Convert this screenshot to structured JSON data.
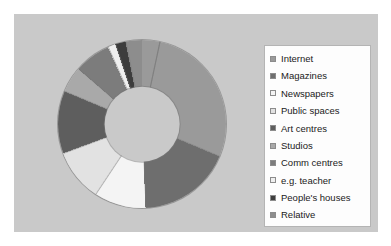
{
  "figure": {
    "background_color": "#c9c9c9",
    "page_color": "#ffffff",
    "legend_background": "#fdfdfd",
    "legend_border_color": "#b4b4b4"
  },
  "legend": {
    "position": "right",
    "items": [
      {
        "label": "Internet",
        "color": "#9a9a9a"
      },
      {
        "label": "Magazines",
        "color": "#6e6e6e"
      },
      {
        "label": "Newspapers",
        "color": "#f4f4f4"
      },
      {
        "label": "Public spaces",
        "color": "#e2e2e2"
      },
      {
        "label": "Art centres",
        "color": "#5e5e5e"
      },
      {
        "label": "Studios",
        "color": "#a9a9a9"
      },
      {
        "label": "Comm centres",
        "color": "#7c7c7c"
      },
      {
        "label": "e.g. teacher",
        "color": "#efefef"
      },
      {
        "label": "People's houses",
        "color": "#3d3d3d"
      },
      {
        "label": "Relative",
        "color": "#8d8d8d"
      }
    ]
  },
  "chart_data": {
    "type": "pie",
    "variant": "doughnut",
    "title": "",
    "subtitle": "",
    "xlabel": "",
    "ylabel": "",
    "grid": false,
    "legend_position": "right",
    "hole_ratio": 0.445,
    "start_angle_deg": 12,
    "direction": "clockwise",
    "categories": [
      "Internet",
      "Magazines",
      "Newspapers",
      "Public spaces",
      "Art centres",
      "Studios",
      "Comm centres",
      "e.g. teacher",
      "People's houses",
      "Relative"
    ],
    "values": [
      28,
      18,
      10,
      10,
      12,
      5,
      7,
      1.5,
      2,
      6.5
    ],
    "colors": [
      "#9a9a9a",
      "#6e6e6e",
      "#f4f4f4",
      "#e2e2e2",
      "#5e5e5e",
      "#a9a9a9",
      "#7c7c7c",
      "#efefef",
      "#3d3d3d",
      "#8d8d8d"
    ]
  }
}
